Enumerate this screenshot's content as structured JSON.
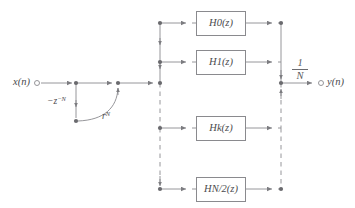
{
  "diagram": {
    "type": "signal-flow-graph",
    "line_color": "#8a8a8e",
    "node_color": "#6a6a6e",
    "text_color": "#4b4b4e",
    "input": {
      "label_main": "x",
      "label_paren_open": "(",
      "label_var": "n",
      "label_paren_close": ")",
      "label": "x(n)",
      "terminal": "open-circle"
    },
    "output": {
      "label": "y(n)",
      "terminal": "open-circle"
    },
    "prefilter": {
      "delay_label_sign": "−",
      "delay_label_base": "z",
      "delay_label_exp": "−N",
      "delay_label": "−z−N",
      "radius_label_base": "r",
      "radius_label_exp": "N",
      "radius_label": "rN",
      "arc_note": "curved arc from delay node up to summing node"
    },
    "gain": {
      "numerator": "1",
      "denominator": "N",
      "label": "1/N"
    },
    "branches": [
      {
        "index": 0,
        "label_base": "H",
        "label_sub": "0",
        "label_tail": "(z)",
        "label": "H0(z)",
        "y": 23
      },
      {
        "index": 1,
        "label_base": "H",
        "label_sub": "1",
        "label_tail": "(z)",
        "label": "H1(z)",
        "y": 62
      },
      {
        "index": 2,
        "label_base": "H",
        "label_sub": "k",
        "label_tail": "(z)",
        "label": "Hk(z)",
        "y": 128
      },
      {
        "index": 3,
        "label_base": "H",
        "label_sub": "N/2",
        "label_tail": "(z)",
        "label": "HN/2(z)",
        "y": 189
      }
    ],
    "buses": {
      "left_x": 160,
      "right_x": 281,
      "dashed_note": "vertical bus lines are dashed between the 2nd and 3rd branch taps"
    }
  }
}
